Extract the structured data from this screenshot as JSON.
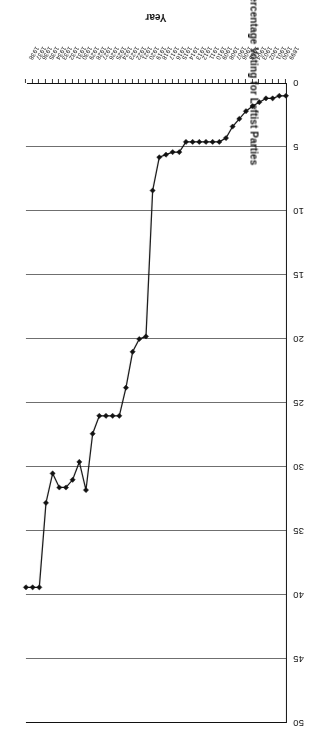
{
  "chart_data": {
    "type": "line",
    "title": "",
    "xlabel": "Year",
    "ylabel": "Percentage Voting for Leftist Parties",
    "ylim": [
      0,
      50
    ],
    "ytick_step": 5,
    "yticks": [
      0,
      5,
      10,
      15,
      20,
      25,
      30,
      35,
      40,
      45,
      50
    ],
    "ytick_labels": [
      "0",
      "5",
      "10",
      "15",
      "20",
      "25",
      "30",
      "35",
      "40",
      "45",
      "50"
    ],
    "grid": "horizontal",
    "legend": "none",
    "marker": "filled-diamond",
    "line_color": "#111111",
    "grid_color": "#6f6f6f",
    "orientation_note": "page-rotated-180",
    "categories": [
      "1899",
      "1900",
      "1901",
      "1902",
      "1903",
      "1904",
      "1905",
      "1906",
      "1907",
      "1908",
      "1909",
      "1910",
      "1911",
      "1912",
      "1913",
      "1914",
      "1915",
      "1916",
      "1917",
      "1918",
      "1919",
      "1920",
      "1921",
      "1922",
      "1923",
      "1924",
      "1925",
      "1926",
      "1927",
      "1928",
      "1929",
      "1930",
      "1931",
      "1932",
      "1933",
      "1934",
      "1935",
      "1936",
      "1937",
      "1938"
    ],
    "values": [
      1.0,
      1.0,
      1.2,
      1.2,
      1.5,
      1.8,
      2.2,
      2.8,
      3.4,
      4.3,
      4.6,
      4.6,
      4.6,
      4.6,
      4.6,
      4.6,
      5.4,
      5.4,
      5.6,
      5.8,
      8.4,
      19.8,
      20.0,
      21.0,
      23.8,
      26.0,
      26.0,
      26.0,
      26.0,
      27.4,
      31.8,
      29.6,
      31.0,
      31.6,
      31.6,
      30.5,
      32.8,
      39.4,
      39.4,
      39.4
    ],
    "series": [
      {
        "name": "Percentage Voting for Leftist Parties",
        "values": [
          1.0,
          1.0,
          1.2,
          1.2,
          1.5,
          1.8,
          2.2,
          2.8,
          3.4,
          4.3,
          4.6,
          4.6,
          4.6,
          4.6,
          4.6,
          4.6,
          5.4,
          5.4,
          5.6,
          5.8,
          8.4,
          19.8,
          20.0,
          21.0,
          23.8,
          26.0,
          26.0,
          26.0,
          26.0,
          27.4,
          31.8,
          29.6,
          31.0,
          31.6,
          31.6,
          30.5,
          32.8,
          39.4,
          39.4,
          39.4
        ]
      }
    ]
  }
}
